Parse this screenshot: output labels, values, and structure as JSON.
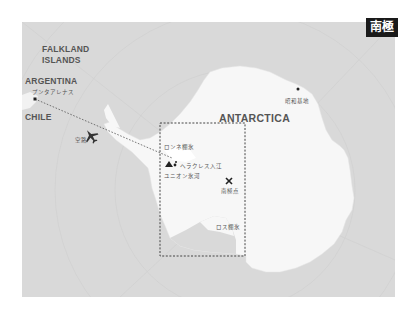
{
  "title_badge": "南極",
  "labels": {
    "falkland_line1": "FALKLAND",
    "falkland_line2": "ISLANDS",
    "argentina": "ARGENTINA",
    "chile": "CHILE",
    "antarctica": "ANTARCTICA",
    "punta_arenas": "プンタアレナス",
    "airplane": "空路",
    "ronne": "ロンネ棚氷",
    "hercules": "ヘラクレス入江",
    "union": "ユニオン氷河",
    "south_pole": "南極点",
    "ross": "ロス棚氷",
    "showa": "昭和基地"
  },
  "icons": {
    "airplane": "airplane-icon",
    "mountain": "mountain-icon",
    "south_pole_marker": "x-marker-icon",
    "city_marker": "square-dot-icon"
  },
  "colors": {
    "ocean": "#d9d9d9",
    "land": "#f7f7f7",
    "badge_bg": "#1a1a1a",
    "label": "#555555",
    "route": "#555555"
  }
}
